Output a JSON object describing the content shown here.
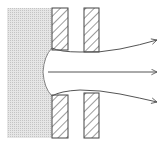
{
  "diagram": {
    "colors": {
      "background": "#ffffff",
      "plasma_fill": "#e2e2e2",
      "plasma_dots": "#c8c8c8",
      "line": "#555555",
      "hatch": "#4a4a4a"
    },
    "elements": {
      "plasma_region": "plasma",
      "electrodes": [
        "first-electrode-top",
        "first-electrode-bottom",
        "second-electrode-top",
        "second-electrode-bottom"
      ],
      "beam_arrows": [
        "upper-arrow",
        "center-arrow",
        "lower-arrow"
      ]
    }
  }
}
